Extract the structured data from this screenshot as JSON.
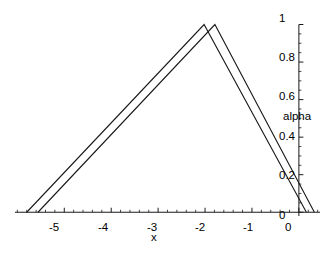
{
  "chart_data": {
    "type": "line",
    "title": "",
    "subtitle": "",
    "xlabel": "x",
    "ylabel": "alpha",
    "xlim": [
      -6.05,
      0.45
    ],
    "ylim": [
      -0.02,
      1.04
    ],
    "grid": false,
    "legend": null,
    "x_ticks": [
      -5,
      -4,
      -3,
      -2,
      -1,
      0
    ],
    "x_tick_labels": [
      "-5",
      "-4",
      "-3",
      "-2",
      "-1",
      "0"
    ],
    "x_minor_tick_step": 0.2,
    "y_ticks": [
      0,
      0.2,
      0.4,
      0.6,
      0.8,
      1
    ],
    "y_tick_labels": [
      "0",
      "0.2",
      "0.4",
      "0.6",
      "0.8",
      "1"
    ],
    "y_minor_tick_step": 0.05,
    "y_axis_position_x": 0,
    "y_axis_label_side": "right",
    "line_color": "#1a1a1a",
    "line_width": 1.1,
    "series": [
      {
        "name": "curve-1",
        "points": [
          [
            -5.8,
            0.0
          ],
          [
            -2.02,
            1.0
          ],
          [
            0.16,
            0.0
          ]
        ]
      },
      {
        "name": "curve-2",
        "points": [
          [
            -5.56,
            0.0
          ],
          [
            -1.79,
            1.0
          ],
          [
            0.33,
            0.0
          ]
        ]
      }
    ]
  },
  "axes": {
    "x_label": "x",
    "y_label": "alpha",
    "x_tick_labels": [
      "-5",
      "-4",
      "-3",
      "-2",
      "-1",
      "0"
    ],
    "y_tick_labels": [
      "0",
      "0.2",
      "0.4",
      "0.6",
      "0.8",
      "1"
    ]
  }
}
